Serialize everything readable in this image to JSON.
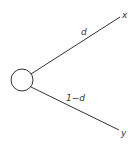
{
  "diagram": {
    "type": "probability-tree",
    "root": {
      "shape": "circle"
    },
    "branches": [
      {
        "label": "d",
        "outcome": "x"
      },
      {
        "label": "1−d",
        "outcome": "y"
      }
    ]
  }
}
